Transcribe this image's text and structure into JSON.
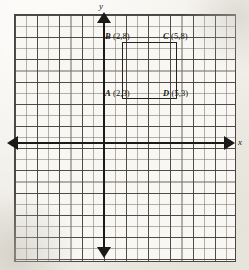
{
  "figure": {
    "background_color": "#f4f2ee",
    "grid_line_color": "#3e3b36",
    "axis_color": "#1b1a18",
    "shape_color": "#26241f"
  },
  "axes": {
    "x_label": "x",
    "y_label": "y",
    "x_arrow_left": "arrow-left",
    "x_arrow_right": "arrow-right",
    "y_arrow_up": "arrow-up",
    "y_arrow_down": "arrow-down"
  },
  "labels": {
    "A": {
      "point": "A",
      "coords": "(2,3)"
    },
    "B": {
      "point": "B",
      "coords": "(2,8)"
    },
    "C": {
      "point": "C",
      "coords": "(5,8)"
    },
    "D": {
      "point": "D",
      "coords": "(5,3)"
    }
  },
  "chart_data": {
    "type": "scatter",
    "xlabel": "x",
    "ylabel": "y",
    "grid": true,
    "legend": "none",
    "xlim": [
      -8,
      12
    ],
    "ylim": [
      -9,
      11
    ],
    "points": [
      {
        "name": "A",
        "x": 2,
        "y": 3,
        "label": "A (2,3)"
      },
      {
        "name": "B",
        "x": 2,
        "y": 8,
        "label": "B (2,8)"
      },
      {
        "name": "C",
        "x": 5,
        "y": 8,
        "label": "C (5,8)"
      },
      {
        "name": "D",
        "x": 5,
        "y": 3,
        "label": "D (5,3)"
      }
    ],
    "shapes": [
      {
        "type": "rectangle",
        "vertices": [
          "B",
          "C",
          "D",
          "A"
        ],
        "x": [
          2,
          5,
          5,
          2
        ],
        "y": [
          8,
          8,
          3,
          3
        ],
        "width": 3,
        "height": 5,
        "filled": false
      }
    ]
  }
}
